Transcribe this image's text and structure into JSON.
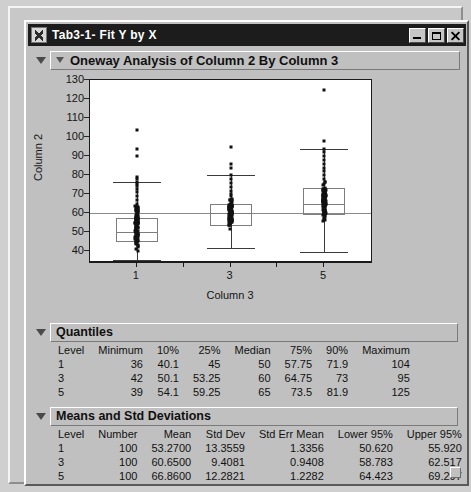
{
  "window": {
    "title": "Tab3-1- Fit Y by X",
    "icon": "jmp-app-icon",
    "minimize_label": "Minimize",
    "maximize_label": "Maximize",
    "close_label": "Close"
  },
  "sections": {
    "oneway": {
      "title": "Oneway Analysis of Column 2 By Column 3"
    },
    "quantiles": {
      "title": "Quantiles"
    },
    "means": {
      "title": "Means and Std Deviations"
    }
  },
  "quantiles_table": {
    "headers": [
      "Level",
      "Minimum",
      "10%",
      "25%",
      "Median",
      "75%",
      "90%",
      "Maximum"
    ],
    "rows": [
      [
        "1",
        "36",
        "40.1",
        "45",
        "50",
        "57.75",
        "71.9",
        "104"
      ],
      [
        "3",
        "42",
        "50.1",
        "53.25",
        "60",
        "64.75",
        "73",
        "95"
      ],
      [
        "5",
        "39",
        "54.1",
        "59.25",
        "65",
        "73.5",
        "81.9",
        "125"
      ]
    ]
  },
  "means_table": {
    "headers": [
      "Level",
      "Number",
      "Mean",
      "Std Dev",
      "Std Err Mean",
      "Lower 95%",
      "Upper 95%"
    ],
    "rows": [
      [
        "1",
        "100",
        "53.2700",
        "13.3559",
        "1.3356",
        "50.620",
        "55.920"
      ],
      [
        "3",
        "100",
        "60.6500",
        "9.4081",
        "0.9408",
        "58.783",
        "62.517"
      ],
      [
        "5",
        "100",
        "66.8600",
        "12.2821",
        "1.2282",
        "64.423",
        "69.297"
      ]
    ]
  },
  "chart_data": {
    "type": "box",
    "title": "Oneway Analysis of Column 2 By Column 3",
    "xlabel": "Column 3",
    "ylabel": "Column 2",
    "ylim": [
      35,
      130
    ],
    "yticks": [
      40,
      50,
      60,
      70,
      80,
      90,
      100,
      110,
      120,
      130
    ],
    "categories": [
      "1",
      "3",
      "5"
    ],
    "grid": false,
    "grand_mean": 60.26,
    "series": [
      {
        "name": "1",
        "n": 100,
        "min": 36,
        "q10": 40.1,
        "q25": 45,
        "median": 50,
        "q75": 57.75,
        "q90": 71.9,
        "max": 104,
        "mean": 53.27,
        "std_dev": 13.3559,
        "std_err": 1.3356,
        "ci_lower": 50.62,
        "ci_upper": 55.92,
        "whisker_low": 35.5,
        "whisker_high": 76.5,
        "outliers": [
          104,
          94,
          90,
          79,
          78,
          76.5,
          75.5,
          74.5,
          73,
          71,
          69,
          67,
          65,
          63,
          61
        ]
      },
      {
        "name": "3",
        "n": 100,
        "min": 42,
        "q10": 50.1,
        "q25": 53.25,
        "median": 60,
        "q75": 64.75,
        "q90": 73,
        "max": 95,
        "mean": 60.65,
        "std_dev": 9.4081,
        "std_err": 0.9408,
        "ci_lower": 58.783,
        "ci_upper": 62.517,
        "whisker_low": 42,
        "whisker_high": 80,
        "outliers": [
          95,
          86,
          84,
          80,
          78,
          76,
          74,
          72,
          70
        ]
      },
      {
        "name": "5",
        "n": 100,
        "min": 39,
        "q10": 54.1,
        "q25": 59.25,
        "median": 65,
        "q75": 73.5,
        "q90": 81.9,
        "max": 125,
        "mean": 66.86,
        "std_dev": 12.2821,
        "std_err": 1.2282,
        "ci_lower": 64.423,
        "ci_upper": 69.297,
        "whisker_low": 39.5,
        "whisker_high": 94,
        "outliers": [
          125,
          98,
          94,
          92,
          90,
          88,
          86,
          84,
          82,
          80,
          78
        ]
      }
    ]
  }
}
